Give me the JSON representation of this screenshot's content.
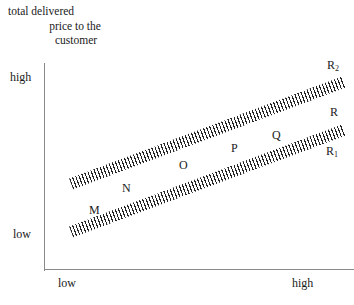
{
  "chart_data": {
    "type": "line",
    "title": "",
    "ylabel": "total delivered price to the customer",
    "xlabel": "",
    "grid": false,
    "legend": "none",
    "x_axis": {
      "ticks": [
        "low",
        "high"
      ],
      "range_label_low": "low",
      "range_label_high": "high"
    },
    "y_axis": {
      "ticks": [
        "low",
        "high"
      ],
      "range_label_low": "low",
      "range_label_high": "high"
    },
    "series": [
      {
        "name": "R2",
        "style": "hatched-band",
        "end_label": "R2",
        "start": {
          "x": 0.09,
          "y": 0.42
        },
        "end": {
          "x": 0.97,
          "y": 0.91
        },
        "description": "upper hatched band rising from lower-left to upper-right"
      },
      {
        "name": "R1",
        "style": "hatched-band",
        "end_label": "R1",
        "start": {
          "x": 0.09,
          "y": 0.18
        },
        "end": {
          "x": 0.97,
          "y": 0.67
        },
        "description": "lower hatched band rising parallel to the upper band"
      }
    ],
    "annotations": [
      {
        "label": "M",
        "x": 0.16,
        "y": 0.28
      },
      {
        "label": "N",
        "x": 0.27,
        "y": 0.39
      },
      {
        "label": "O",
        "x": 0.45,
        "y": 0.5
      },
      {
        "label": "P",
        "x": 0.62,
        "y": 0.58
      },
      {
        "label": "Q",
        "x": 0.75,
        "y": 0.65
      },
      {
        "label": "R",
        "x": 0.94,
        "y": 0.79
      }
    ]
  },
  "axis_title": {
    "line1": "total delivered",
    "line2": "price to the",
    "line3": "customer"
  },
  "y_axis": {
    "high": "high",
    "low": "low"
  },
  "x_axis": {
    "low": "low",
    "high": "high"
  },
  "labels": {
    "M": "M",
    "N": "N",
    "O": "O",
    "P": "P",
    "Q": "Q",
    "R": "R",
    "R1_base": "R",
    "R1_sub": "1",
    "R2_base": "R",
    "R2_sub": "2"
  },
  "colors": {
    "axis": "#8a8a8a",
    "hatch": "#262626",
    "text": "#1a1a1a",
    "background": "#ffffff"
  }
}
